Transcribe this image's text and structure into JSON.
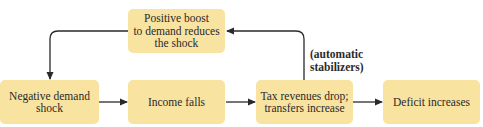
{
  "diagram": {
    "nodes": {
      "negative_shock": {
        "lines": [
          "Negative demand",
          "shock"
        ]
      },
      "income_falls": {
        "lines": [
          "Income falls"
        ]
      },
      "tax_revenues": {
        "lines": [
          "Tax revenues drop;",
          "transfers increase"
        ]
      },
      "deficit": {
        "lines": [
          "Deficit increases"
        ]
      },
      "positive_boost": {
        "lines": [
          "Positive boost",
          "to demand reduces",
          "the shock"
        ]
      }
    },
    "annotation": {
      "lines": [
        "(automatic",
        "stabilizers)"
      ]
    },
    "edges": [
      {
        "from": "negative_shock",
        "to": "income_falls"
      },
      {
        "from": "income_falls",
        "to": "tax_revenues"
      },
      {
        "from": "tax_revenues",
        "to": "deficit"
      },
      {
        "from": "tax_revenues",
        "to": "positive_boost",
        "label": "annotation"
      },
      {
        "from": "positive_boost",
        "to": "negative_shock"
      }
    ],
    "colors": {
      "box_fill": "#f9e3a1",
      "arrow": "#2a2a2a"
    }
  }
}
